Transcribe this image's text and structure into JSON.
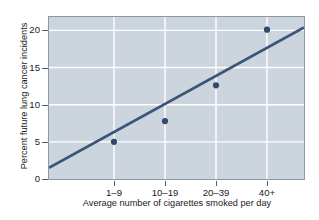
{
  "chart_data": {
    "type": "scatter",
    "title": "",
    "xlabel": "Average number of cigarettes smoked per day",
    "ylabel": "Percent future lung cancer incidents",
    "categories": [
      "1–9",
      "10–19",
      "20–39",
      "40+"
    ],
    "values": [
      5.0,
      7.8,
      12.6,
      20.1
    ],
    "series": [
      {
        "name": "Lung cancer incidents",
        "values": [
          5.0,
          7.8,
          12.6,
          20.1
        ]
      }
    ],
    "trend_line": {
      "type": "line",
      "x_start_fraction": 0.0,
      "y_start": 1.5,
      "x_end_fraction": 1.0,
      "y_end": 20.4
    },
    "ylim": [
      0,
      21.8
    ],
    "yticks": [
      0,
      5,
      10,
      15,
      20
    ],
    "ytick_labels": [
      "0",
      "5",
      "10",
      "15",
      "20"
    ],
    "grid": true,
    "grid_color": "#ffffff",
    "legend": "none",
    "plot_background": "#ccd5dd",
    "marker_color": "#2f4a6b",
    "line_color": "#3a5578",
    "figure_background": "#ffffff"
  }
}
